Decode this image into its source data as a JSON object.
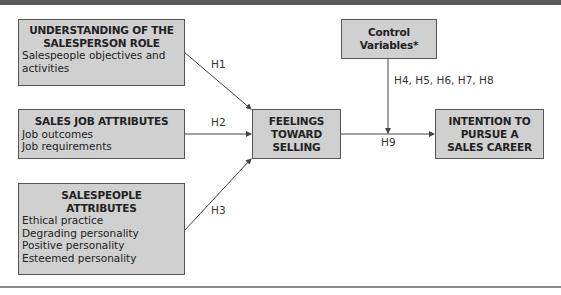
{
  "diagram": {
    "nodes": {
      "understanding": {
        "title": [
          "UNDERSTANDING OF THE",
          "SALESPERSON ROLE"
        ],
        "items": [
          "Salespeople objectives and",
          "activities"
        ]
      },
      "job_attributes": {
        "title": [
          "SALES JOB ATTRIBUTES"
        ],
        "items": [
          "Job outcomes",
          "Job requirements"
        ]
      },
      "salespeople_attributes": {
        "title": [
          "SALESPEOPLE",
          "ATTRIBUTES"
        ],
        "items": [
          "Ethical practice",
          "Degrading personality",
          "Positive personality",
          "Esteemed personality"
        ]
      },
      "feelings": {
        "title": [
          "FEELINGS",
          "TOWARD",
          "SELLING"
        ]
      },
      "control": {
        "title": [
          "Control",
          "Variables*"
        ]
      },
      "intention": {
        "title": [
          "INTENTION TO",
          "PURSUE A",
          "SALES CAREER"
        ]
      }
    },
    "edges": {
      "h1": "H1",
      "h2": "H2",
      "h3": "H3",
      "h4_8": "H4, H5, H6, H7, H8",
      "h9": "H9"
    },
    "colors": {
      "box_fill": "#d0d0d0",
      "box_border": "#555555",
      "arrow": "#444444",
      "top_band": "#5a5a5a"
    }
  }
}
